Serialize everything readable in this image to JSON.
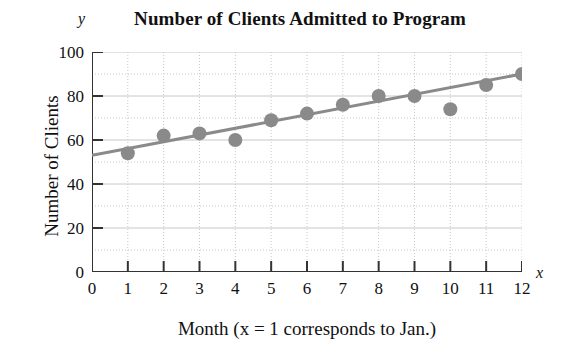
{
  "chart_data": {
    "type": "scatter",
    "title": "Number of Clients Admitted to Program",
    "xlabel": "Month (x = 1 corresponds to Jan.)",
    "ylabel": "Number of Clients",
    "x_axis_symbol": "x",
    "y_axis_symbol": "y",
    "xlim": [
      0,
      12
    ],
    "ylim": [
      0,
      100
    ],
    "x_ticks": [
      0,
      1,
      2,
      3,
      4,
      5,
      6,
      7,
      8,
      9,
      10,
      11,
      12
    ],
    "y_ticks": [
      0,
      20,
      40,
      60,
      80,
      100
    ],
    "x_tick_labels": [
      "0",
      "1",
      "2",
      "3",
      "4",
      "5",
      "6",
      "7",
      "8",
      "9",
      "10",
      "11",
      "12"
    ],
    "y_tick_labels": [
      "0",
      "20",
      "40",
      "60",
      "80",
      "100"
    ],
    "grid": true,
    "grid_x_step": 1,
    "grid_y_step": 10,
    "legend": false,
    "x": [
      1,
      2,
      3,
      4,
      5,
      6,
      7,
      8,
      9,
      10,
      11,
      12
    ],
    "values": [
      54,
      62,
      63,
      60,
      69,
      72,
      76,
      80,
      80,
      74,
      85,
      90
    ],
    "series": [
      {
        "name": "Clients admitted",
        "type": "scatter",
        "marker": "circle",
        "color": "#8a8a8a",
        "values": [
          54,
          62,
          63,
          60,
          69,
          72,
          76,
          80,
          80,
          74,
          85,
          90
        ]
      },
      {
        "name": "Trend line",
        "type": "line",
        "color": "#8a8a8a",
        "endpoints": [
          [
            0,
            53
          ],
          [
            12,
            90
          ]
        ]
      }
    ],
    "colors": {
      "marker": "#8a8a8a",
      "trend_line": "#8a8a8a",
      "axis": "#333333",
      "grid": "#c8c8c8",
      "text": "#111111",
      "background": "#ffffff"
    }
  }
}
